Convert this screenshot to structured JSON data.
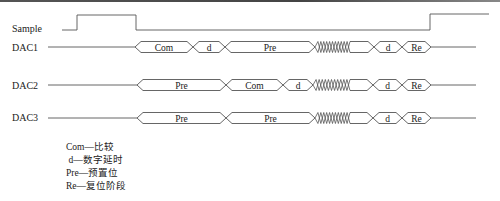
{
  "diagram": {
    "type": "timing-diagram",
    "signals": [
      {
        "name": "Sample",
        "label_y": 32
      },
      {
        "name": "DAC1",
        "label_y": 51
      },
      {
        "name": "DAC2",
        "label_y": 89
      },
      {
        "name": "DAC3",
        "label_y": 121
      }
    ],
    "sample_waveform": {
      "low_y": 30,
      "high_y": 15,
      "points": [
        [
          62,
          30
        ],
        [
          77,
          30
        ],
        [
          77,
          15
        ],
        [
          136,
          15
        ],
        [
          136,
          30
        ],
        [
          430,
          30
        ],
        [
          430,
          14
        ],
        [
          489,
          14
        ]
      ]
    },
    "bus_rows": [
      {
        "signal": "DAC1",
        "center_y": 47,
        "line_start": 48,
        "bus_start": 135,
        "line_end": 476,
        "segments": [
          {
            "label": "Com",
            "start": 135,
            "end": 193,
            "kind": "data"
          },
          {
            "label": "d",
            "start": 193,
            "end": 225,
            "kind": "data"
          },
          {
            "label": "Pre",
            "start": 225,
            "end": 315,
            "kind": "data"
          },
          {
            "label": "",
            "start": 315,
            "end": 350,
            "kind": "transition"
          },
          {
            "label": "",
            "start": 350,
            "end": 374,
            "kind": "data"
          },
          {
            "label": "d",
            "start": 374,
            "end": 402,
            "kind": "data"
          },
          {
            "label": "Re",
            "start": 402,
            "end": 431,
            "kind": "data"
          }
        ]
      },
      {
        "signal": "DAC2",
        "center_y": 85,
        "line_start": 48,
        "bus_start": 137,
        "line_end": 476,
        "segments": [
          {
            "label": "Pre",
            "start": 137,
            "end": 226,
            "kind": "data"
          },
          {
            "label": "Com",
            "start": 226,
            "end": 283,
            "kind": "data"
          },
          {
            "label": "d",
            "start": 283,
            "end": 313,
            "kind": "data"
          },
          {
            "label": "",
            "start": 313,
            "end": 350,
            "kind": "transition"
          },
          {
            "label": "",
            "start": 350,
            "end": 373,
            "kind": "data"
          },
          {
            "label": "d",
            "start": 373,
            "end": 402,
            "kind": "data"
          },
          {
            "label": "Re",
            "start": 402,
            "end": 431,
            "kind": "data"
          }
        ]
      },
      {
        "signal": "DAC3",
        "center_y": 118,
        "line_start": 48,
        "bus_start": 137,
        "line_end": 476,
        "segments": [
          {
            "label": "Pre",
            "start": 137,
            "end": 226,
            "kind": "data"
          },
          {
            "label": "Pre",
            "start": 226,
            "end": 315,
            "kind": "data"
          },
          {
            "label": "",
            "start": 315,
            "end": 350,
            "kind": "transition"
          },
          {
            "label": "",
            "start": 350,
            "end": 373,
            "kind": "data"
          },
          {
            "label": "d",
            "start": 373,
            "end": 402,
            "kind": "data"
          },
          {
            "label": "Re",
            "start": 402,
            "end": 431,
            "kind": "data"
          }
        ]
      }
    ],
    "half_height": 5.5,
    "colors": {
      "line": "#555555",
      "text": "#222222",
      "background": "#ffffff"
    }
  },
  "legend": {
    "items": [
      {
        "abbr": "Com",
        "sep": "—",
        "meaning": "比较"
      },
      {
        "abbr": "d",
        "sep": "—",
        "meaning": "数字延时"
      },
      {
        "abbr": "Pre",
        "sep": "—",
        "meaning": "预置位"
      },
      {
        "abbr": "Re",
        "sep": "—",
        "meaning": "复位阶段"
      }
    ]
  }
}
